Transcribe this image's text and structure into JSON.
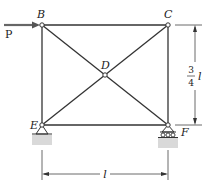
{
  "diagram": {
    "type": "truss",
    "nodes": [
      {
        "id": "B",
        "label": "B",
        "x": 42,
        "y": 25
      },
      {
        "id": "C",
        "label": "C",
        "x": 168,
        "y": 25
      },
      {
        "id": "D",
        "label": "D",
        "x": 105,
        "y": 75
      },
      {
        "id": "E",
        "label": "E",
        "x": 42,
        "y": 125
      },
      {
        "id": "F",
        "label": "F",
        "x": 168,
        "y": 125
      }
    ],
    "members": [
      "B-C",
      "B-E",
      "C-F",
      "E-F",
      "B-D",
      "D-F",
      "C-D",
      "D-E"
    ],
    "load": {
      "label": "P",
      "at": "B",
      "direction": "right"
    },
    "supports": [
      {
        "node": "E",
        "type": "pin"
      },
      {
        "node": "F",
        "type": "roller"
      }
    ],
    "dimensions": {
      "height": {
        "numerator": "3",
        "denominator": "4",
        "symbol": "l"
      },
      "width": {
        "symbol": "l"
      }
    }
  },
  "colors": {
    "line": "#333333",
    "ground": "#d9d9d9"
  }
}
